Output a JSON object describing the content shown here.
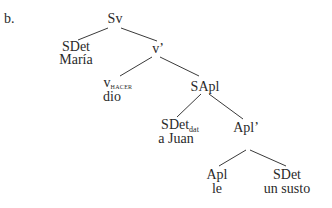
{
  "example_label": "b.",
  "tree": {
    "root": {
      "label": "Sv"
    },
    "spec_root": {
      "label": "SDet",
      "word": "María"
    },
    "v_bar": {
      "label": "v’"
    },
    "v_head": {
      "label": "v",
      "subscript": "HACER",
      "word": "dio"
    },
    "sapl": {
      "label": "SApl"
    },
    "sdet_dat": {
      "label": "SDet",
      "subscript": "dat",
      "word": "a Juan"
    },
    "apl_bar": {
      "label": "Apl’"
    },
    "apl_head": {
      "label": "Apl",
      "word": "le"
    },
    "sdet_obj": {
      "label": "SDet",
      "word": "un susto"
    }
  },
  "edges": [
    [
      "Sv",
      "SDet"
    ],
    [
      "Sv",
      "v’"
    ],
    [
      "v’",
      "v_HACER"
    ],
    [
      "v’",
      "SApl"
    ],
    [
      "SApl",
      "SDet_dat"
    ],
    [
      "SApl",
      "Apl’"
    ],
    [
      "Apl’",
      "Apl"
    ],
    [
      "Apl’",
      "SDet"
    ]
  ]
}
